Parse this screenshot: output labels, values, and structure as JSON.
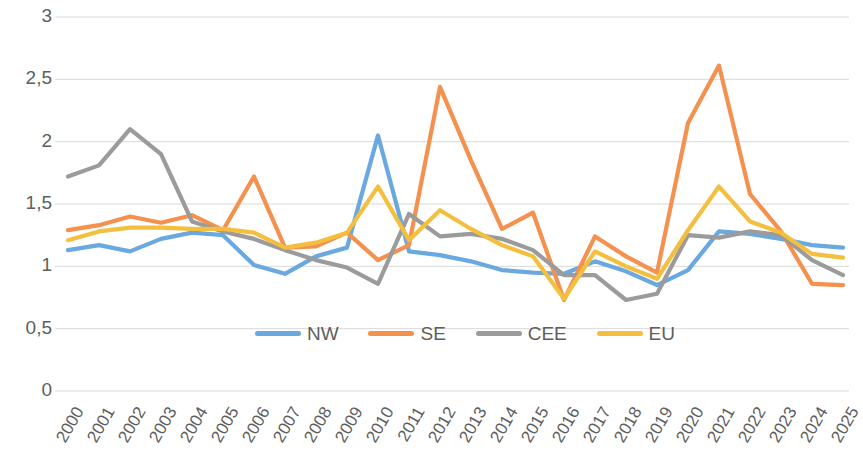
{
  "chart_data": {
    "type": "line",
    "title": "",
    "subtitle": "",
    "xlabel": "",
    "ylabel": "",
    "categories": [
      "2000",
      "2001",
      "2002",
      "2003",
      "2004",
      "2005",
      "2006",
      "2007",
      "2008",
      "2009",
      "2010",
      "2011",
      "2012",
      "2013",
      "2014",
      "2015",
      "2016",
      "2017",
      "2018",
      "2019",
      "2020",
      "2021",
      "2022",
      "2023",
      "2024",
      "2025"
    ],
    "ylim": [
      0,
      3
    ],
    "ytick_labels": [
      "0",
      "0,5",
      "1",
      "1,5",
      "2",
      "2,5",
      "3"
    ],
    "ytick_values": [
      0,
      0.5,
      1,
      1.5,
      2,
      2.5,
      3
    ],
    "grid": true,
    "legend_position": "inside-bottom-center",
    "series": [
      {
        "name": "NW",
        "color": "#6aa9e0",
        "values": [
          1.13,
          1.17,
          1.12,
          1.22,
          1.27,
          1.25,
          1.01,
          0.94,
          1.08,
          1.15,
          2.05,
          1.12,
          1.09,
          1.04,
          0.97,
          0.95,
          0.94,
          1.04,
          0.96,
          0.85,
          0.97,
          1.28,
          1.26,
          1.22,
          1.17,
          1.15
        ]
      },
      {
        "name": "SE",
        "color": "#f4914e",
        "values": [
          1.29,
          1.33,
          1.4,
          1.35,
          1.41,
          1.29,
          1.72,
          1.15,
          1.16,
          1.27,
          1.05,
          1.17,
          2.44,
          1.85,
          1.3,
          1.43,
          0.73,
          1.24,
          1.08,
          0.95,
          2.15,
          2.61,
          1.58,
          1.28,
          0.86,
          0.85
        ]
      },
      {
        "name": "CEE",
        "color": "#9b9b9b",
        "values": [
          1.72,
          1.81,
          2.1,
          1.9,
          1.36,
          1.28,
          1.22,
          1.13,
          1.05,
          0.99,
          0.86,
          1.42,
          1.24,
          1.26,
          1.22,
          1.13,
          0.93,
          0.93,
          0.73,
          0.78,
          1.25,
          1.23,
          1.28,
          1.25,
          1.05,
          0.93
        ]
      },
      {
        "name": "EU",
        "color": "#f4bf3e",
        "values": [
          1.21,
          1.28,
          1.31,
          1.31,
          1.3,
          1.3,
          1.27,
          1.15,
          1.19,
          1.27,
          1.64,
          1.21,
          1.45,
          1.3,
          1.17,
          1.08,
          0.74,
          1.12,
          1.0,
          0.9,
          1.29,
          1.64,
          1.36,
          1.27,
          1.1,
          1.07
        ]
      }
    ]
  },
  "legend": {
    "items": [
      {
        "label": "NW",
        "color": "#6aa9e0"
      },
      {
        "label": "SE",
        "color": "#f4914e"
      },
      {
        "label": "CEE",
        "color": "#9b9b9b"
      },
      {
        "label": "EU",
        "color": "#f4bf3e"
      }
    ]
  },
  "colors": {
    "grid": "#d9d9d9",
    "tick_text": "#5e5e5e",
    "background": "#ffffff"
  }
}
